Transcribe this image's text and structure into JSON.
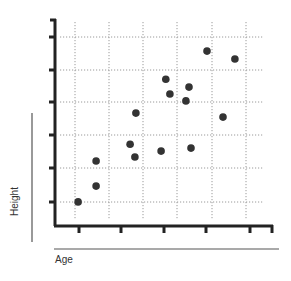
{
  "chart_data": {
    "type": "scatter",
    "title": "",
    "xlabel": "Age",
    "ylabel": "Height",
    "grid": true,
    "legend": null,
    "xlim": [
      0,
      6.5
    ],
    "ylim": [
      0,
      6.2
    ],
    "x_tick_labels": [],
    "y_tick_labels": [],
    "points": [
      {
        "x": 0.68,
        "y": 0.73
      },
      {
        "x": 1.21,
        "y": 1.21
      },
      {
        "x": 1.21,
        "y": 1.97
      },
      {
        "x": 2.21,
        "y": 2.48
      },
      {
        "x": 2.35,
        "y": 2.09
      },
      {
        "x": 2.38,
        "y": 3.42
      },
      {
        "x": 3.12,
        "y": 2.27
      },
      {
        "x": 3.26,
        "y": 4.45
      },
      {
        "x": 3.38,
        "y": 4.0
      },
      {
        "x": 3.85,
        "y": 3.79
      },
      {
        "x": 3.94,
        "y": 4.21
      },
      {
        "x": 4.0,
        "y": 2.36
      },
      {
        "x": 4.47,
        "y": 5.3
      },
      {
        "x": 4.94,
        "y": 3.3
      },
      {
        "x": 5.29,
        "y": 5.06
      }
    ],
    "marker_color": "#333333",
    "axis_color": "#222222",
    "grid_color": "#9a9a9a"
  }
}
